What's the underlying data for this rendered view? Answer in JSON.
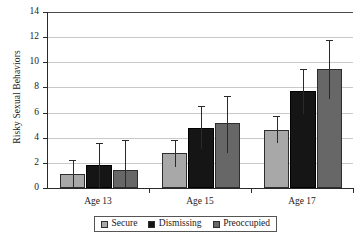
{
  "chart_data": {
    "type": "bar",
    "title": "",
    "xlabel": "",
    "ylabel": "Risky Sexual Behaviors",
    "categories": [
      "Age 13",
      "Age 15",
      "Age 17"
    ],
    "ylim": [
      0,
      14
    ],
    "yticks": [
      0,
      2,
      4,
      6,
      8,
      10,
      12,
      14
    ],
    "ytick_labels": [
      "0",
      "2",
      "4",
      "6",
      "8",
      "10",
      "12",
      "14"
    ],
    "grid": true,
    "grid_axis": "y",
    "legend_position": "bottom",
    "error_bars": "upper-and-lower whiskers",
    "series": [
      {
        "name": "Secure",
        "color": "#a8a8a8",
        "values": [
          1.1,
          2.75,
          4.65
        ],
        "err_upper": [
          2.2,
          3.85,
          5.7
        ],
        "err_lower": [
          0.05,
          1.65,
          3.55
        ]
      },
      {
        "name": "Dismissing",
        "color": "#151515",
        "values": [
          1.85,
          4.8,
          7.7
        ],
        "err_upper": [
          3.6,
          6.5,
          9.5
        ],
        "err_lower": [
          0.0,
          3.1,
          5.9
        ]
      },
      {
        "name": "Preoccupied",
        "color": "#676767",
        "values": [
          1.45,
          5.15,
          9.45
        ],
        "err_upper": [
          3.8,
          7.35,
          11.75
        ],
        "err_lower": [
          0.0,
          2.75,
          7.1
        ]
      }
    ]
  },
  "legend": {
    "items": [
      {
        "label": "Secure",
        "swatch": "secure"
      },
      {
        "label": "Dismissing",
        "swatch": "dismissing"
      },
      {
        "label": "Preoccupied",
        "swatch": "preoccupied"
      }
    ]
  }
}
